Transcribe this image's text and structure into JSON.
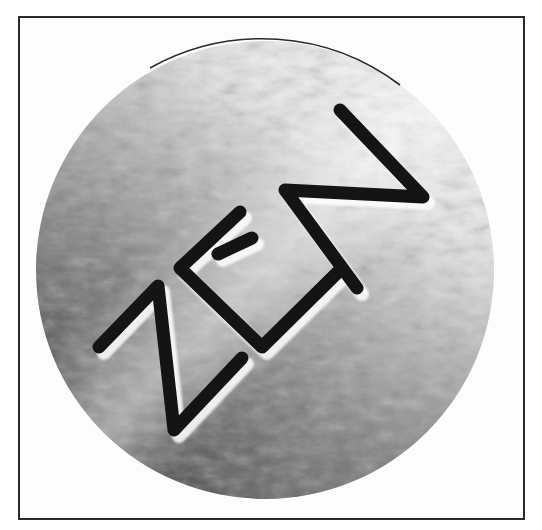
{
  "image": {
    "subject": "metallic-disc-emblem",
    "engraved_text": "ZEN",
    "colors": {
      "frame": "#2a2a2a",
      "background": "#fdfdfd",
      "metal_light": "#f2f2f2",
      "metal_mid": "#9a9a9a",
      "metal_dark": "#3c3c3c",
      "engraving": "#111111"
    }
  }
}
